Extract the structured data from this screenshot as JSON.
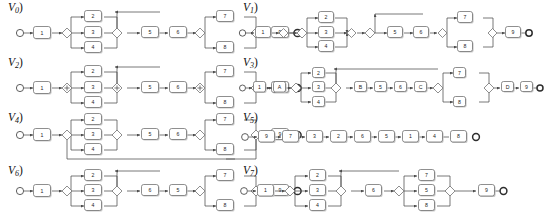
{
  "figure": {
    "caption": "",
    "background": "#ffffff",
    "edge_color": "#4c4c4c",
    "node_stroke": "#6a6a6a",
    "node_fill": "#ffffff"
  },
  "panels": [
    {
      "id": "V0",
      "label_base": "V",
      "label_sub": "0",
      "label_paren": ")",
      "name": "variant-v0",
      "nodes": [
        "1",
        "2",
        "3",
        "4",
        "5",
        "6",
        "7",
        "8",
        "9"
      ],
      "structure": "start -> 1 -> XOR-split -> {2,3,4} -> XOR-join -> 5 -> 6 -> XOR-split -> {7,8} -> XOR-join -> 9 -> end",
      "branches_block1": [
        "2",
        "3",
        "4"
      ],
      "sequence_middle": [
        "5",
        "6"
      ],
      "branches_block2": [
        "7",
        "8"
      ],
      "tail": [
        "9"
      ],
      "has_loop": false
    },
    {
      "id": "V1",
      "label_base": "V",
      "label_sub": "1",
      "label_paren": ")",
      "name": "variant-v1",
      "nodes": [
        "1",
        "2",
        "3",
        "4",
        "5",
        "6",
        "7",
        "8",
        "9"
      ],
      "structure": "start -> 1 -> XOR-split -> XOR-split -> {2,3,4} -> XOR-join -> XOR-join -> 5 -> 6 -> XOR-split -> {7,8} -> XOR-join -> 9 -> end",
      "branches_block1": [
        "2",
        "3",
        "4"
      ],
      "sequence_middle": [
        "5",
        "6"
      ],
      "branches_block2": [
        "7",
        "8"
      ],
      "tail": [
        "9"
      ],
      "has_loop": false,
      "nested_gateways": true
    },
    {
      "id": "V2",
      "label_base": "V",
      "label_sub": "2",
      "label_paren": ")",
      "name": "variant-v2",
      "nodes": [
        "1",
        "2",
        "3",
        "4",
        "5",
        "6",
        "7",
        "8",
        "9"
      ],
      "structure": "start -> 1 -> AND-split -> {2,3,4} -> AND-join -> 5 -> 6 -> AND-split -> {7,8} -> AND-join -> 9 -> end",
      "branches_block1": [
        "2",
        "3",
        "4"
      ],
      "sequence_middle": [
        "5",
        "6"
      ],
      "branches_block2": [
        "7",
        "8"
      ],
      "tail": [
        "9"
      ],
      "has_loop": false,
      "gateway_type": "parallel"
    },
    {
      "id": "V3",
      "label_base": "V",
      "label_sub": "3",
      "label_paren": ")",
      "name": "variant-v3",
      "nodes": [
        "1",
        "A",
        "2",
        "3",
        "4",
        "B",
        "5",
        "6",
        "C",
        "7",
        "8",
        "D",
        "9"
      ],
      "structure": "start -> 1 -> A -> XOR-split -> {2,3,4} -> XOR-join -> B -> 5 -> 6 -> C -> XOR-split -> {7,8} -> XOR-join -> D -> 9 -> end",
      "prefix": [
        "1",
        "A"
      ],
      "branches_block1": [
        "2",
        "3",
        "4"
      ],
      "sequence_middle": [
        "B",
        "5",
        "6",
        "C"
      ],
      "branches_block2": [
        "7",
        "8"
      ],
      "tail": [
        "D",
        "9"
      ],
      "has_loop": false
    },
    {
      "id": "V4",
      "label_base": "V",
      "label_sub": "4",
      "label_paren": ")",
      "name": "variant-v4",
      "nodes": [
        "1",
        "2",
        "3",
        "4",
        "5",
        "6",
        "7",
        "8",
        "9"
      ],
      "structure": "start -> 1 -> XOR-split -> {2,3,4} -> XOR-join -> 5 -> 6 -> XOR-split -> {7,8} -> XOR-join -> 9 -> end, with loop-back edge from final XOR-join to first XOR-split",
      "branches_block1": [
        "2",
        "3",
        "4"
      ],
      "sequence_middle": [
        "5",
        "6"
      ],
      "branches_block2": [
        "7",
        "8"
      ],
      "tail": [
        "9"
      ],
      "has_loop": true,
      "loop_description": "feedback edge from last join gateway back to first split gateway"
    },
    {
      "id": "V5",
      "label_base": "V",
      "label_sub": "5",
      "label_paren": ")",
      "name": "variant-v5",
      "nodes": [
        "9",
        "7",
        "3",
        "2",
        "6",
        "5",
        "1",
        "4",
        "8"
      ],
      "structure": "start -> 9 -> 7 -> 3 -> 2 -> 6 -> 5 -> 1 -> 4 -> 8 -> end",
      "sequence": [
        "9",
        "7",
        "3",
        "2",
        "6",
        "5",
        "1",
        "4",
        "8"
      ],
      "has_loop": false,
      "linear": true
    },
    {
      "id": "V6",
      "label_base": "V",
      "label_sub": "6",
      "label_paren": ")",
      "name": "variant-v6",
      "nodes": [
        "1",
        "2",
        "3",
        "4",
        "6",
        "5",
        "7",
        "8",
        "9"
      ],
      "structure": "start -> 1 -> XOR-split -> {2,3,4} -> XOR-join -> 6 -> 5 -> XOR-split -> {7,8} -> XOR-join -> 9 -> end",
      "branches_block1": [
        "2",
        "3",
        "4"
      ],
      "sequence_middle": [
        "6",
        "5"
      ],
      "branches_block2": [
        "7",
        "8"
      ],
      "tail": [
        "9"
      ],
      "has_loop": false
    },
    {
      "id": "V7",
      "label_base": "V",
      "label_sub": "7",
      "label_paren": ")",
      "name": "variant-v7",
      "nodes": [
        "1",
        "2",
        "3",
        "4",
        "6",
        "7",
        "5",
        "8",
        "9"
      ],
      "structure": "start -> 1 -> XOR-split -> {2,3,4} -> XOR-join -> 6 -> XOR-split -> {7,5,8} -> XOR-join -> 9 -> end",
      "branches_block1": [
        "2",
        "3",
        "4"
      ],
      "sequence_middle": [
        "6"
      ],
      "branches_block2": [
        "7",
        "5",
        "8"
      ],
      "tail": [
        "9"
      ],
      "has_loop": false
    }
  ]
}
